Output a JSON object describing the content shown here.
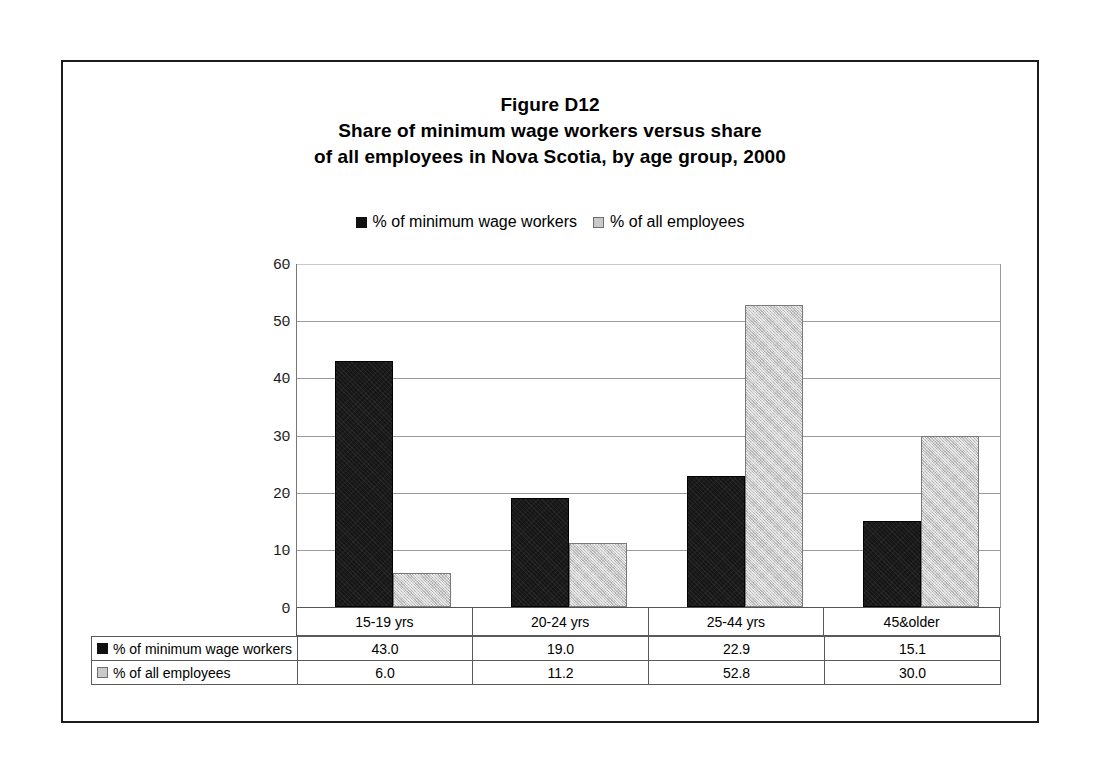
{
  "chart_data": {
    "type": "bar",
    "title": "Figure D12",
    "title_lines": [
      "Figure D12",
      "Share of minimum wage workers versus share",
      "of all employees in Nova Scotia, by age group, 2000"
    ],
    "subtitle": "Share of minimum wage workers versus share of all employees in Nova Scotia, by age group, 2000",
    "xlabel": "",
    "ylabel": "",
    "categories": [
      "15-19 yrs",
      "20-24 yrs",
      "25-44 yrs",
      "45&older"
    ],
    "series": [
      {
        "name": "% of minimum wage workers",
        "color": "#161616",
        "values": [
          43.0,
          19.0,
          22.9,
          15.1
        ],
        "value_labels": [
          "43.0",
          "19.0",
          "22.9",
          "15.1"
        ]
      },
      {
        "name": "% of all employees",
        "color": "#c8c8c8",
        "values": [
          6.0,
          11.2,
          52.8,
          30.0
        ],
        "value_labels": [
          "6.0",
          "11.2",
          "52.8",
          "30.0"
        ]
      }
    ],
    "ylim": [
      0,
      60
    ],
    "yticks": [
      0,
      10,
      20,
      30,
      40,
      50,
      60
    ],
    "ytick_labels": [
      "0",
      "10",
      "20",
      "30",
      "40",
      "50",
      "60"
    ],
    "grid": true,
    "grid_axis": "y",
    "legend_position": "top-center",
    "legend_entries": [
      "% of minimum wage workers",
      "% of all employees"
    ],
    "data_table_visible": true
  },
  "legend": {
    "items": [
      {
        "label": "% of minimum wage workers",
        "swatch": "black-square-icon"
      },
      {
        "label": "% of all employees",
        "swatch": "gray-square-icon"
      }
    ]
  },
  "table": {
    "column_headers": [
      "15-19 yrs",
      "20-24 yrs",
      "25-44 yrs",
      "45&older"
    ],
    "rows": [
      {
        "label": "% of minimum wage workers",
        "cells": [
          "43.0",
          "19.0",
          "22.9",
          "15.1"
        ]
      },
      {
        "label": "% of all employees",
        "cells": [
          "6.0",
          "11.2",
          "52.8",
          "30.0"
        ]
      }
    ]
  },
  "colors": {
    "series_0": "#161616",
    "series_1": "#c8c8c8",
    "series_1_border": "#7a7a7a",
    "gridline": "#9c9c9c",
    "frame": "#1c1c1c",
    "background": "#ffffff"
  }
}
